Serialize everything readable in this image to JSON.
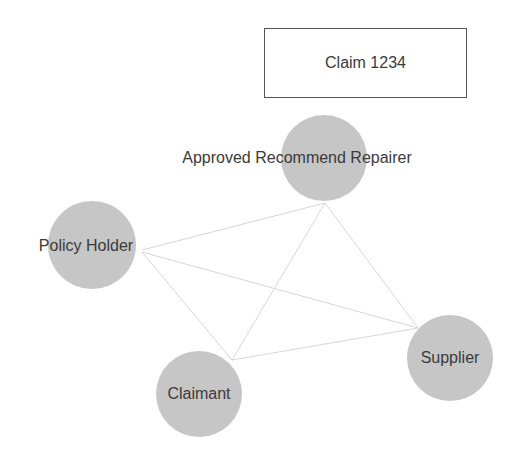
{
  "title_box": {
    "label": "Claim 1234",
    "x": 264,
    "y": 28,
    "w": 203,
    "h": 70,
    "border_color": "#555555"
  },
  "style": {
    "node_fill": "#c6c6c6",
    "edge_color": "#d6d6d6",
    "text_color": "#3a3a3a",
    "background": "#ffffff"
  },
  "nodes": [
    {
      "id": "repairer",
      "label": "Approved Recommend Repairer",
      "cx": 324,
      "cy": 158,
      "r": 43,
      "label_x": 297,
      "label_y": 158
    },
    {
      "id": "policy_holder",
      "label": "Policy Holder",
      "cx": 92,
      "cy": 245,
      "r": 44,
      "label_x": 86,
      "label_y": 246
    },
    {
      "id": "claimant",
      "label": "Claimant",
      "cx": 199,
      "cy": 394,
      "r": 43,
      "label_x": 199,
      "label_y": 394
    },
    {
      "id": "supplier",
      "label": "Supplier",
      "cx": 450,
      "cy": 358,
      "r": 43,
      "label_x": 450,
      "label_y": 358
    }
  ],
  "edges": [
    {
      "from": "policy_holder",
      "to": "repairer",
      "x1": 142,
      "y1": 250,
      "x2": 325,
      "y2": 203
    },
    {
      "from": "repairer",
      "to": "supplier",
      "x1": 325,
      "y1": 203,
      "x2": 418,
      "y2": 328
    },
    {
      "from": "repairer",
      "to": "claimant",
      "x1": 325,
      "y1": 203,
      "x2": 232,
      "y2": 360
    },
    {
      "from": "policy_holder",
      "to": "supplier",
      "x1": 142,
      "y1": 252,
      "x2": 418,
      "y2": 328
    },
    {
      "from": "policy_holder",
      "to": "claimant",
      "x1": 142,
      "y1": 252,
      "x2": 232,
      "y2": 360
    },
    {
      "from": "claimant",
      "to": "supplier",
      "x1": 232,
      "y1": 360,
      "x2": 418,
      "y2": 328
    }
  ]
}
